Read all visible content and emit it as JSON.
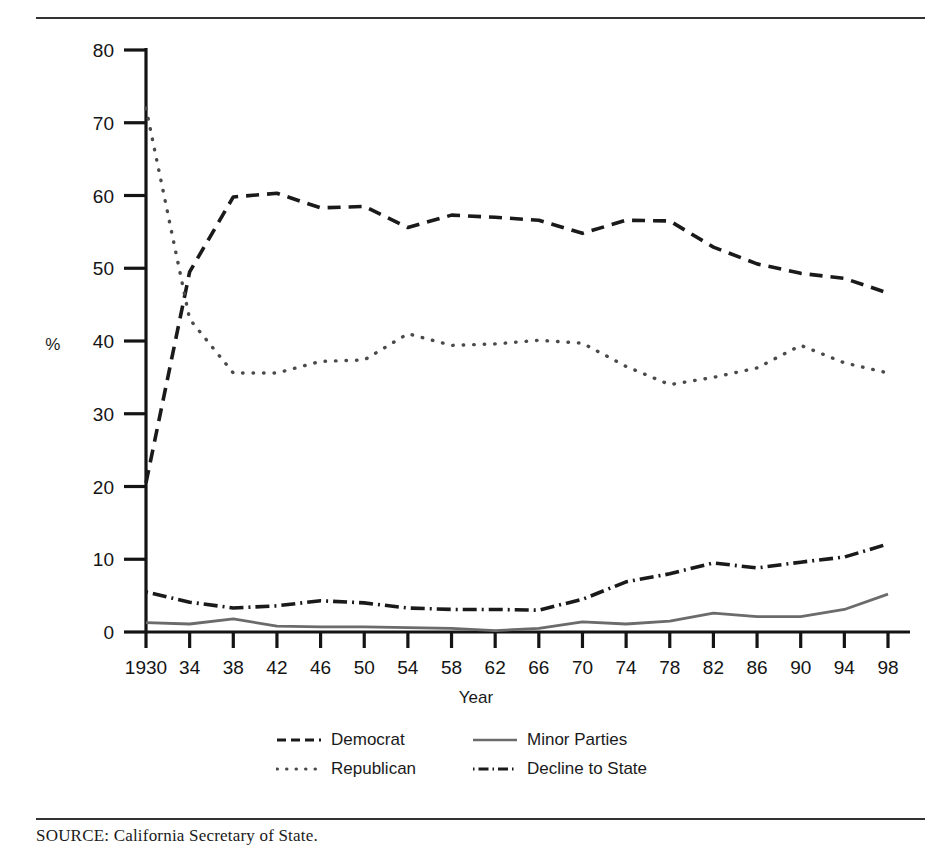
{
  "figure": {
    "ylabel": "%",
    "xlabel": "Year",
    "source_note": "SOURCE: California Secretary of State."
  },
  "legend": {
    "position": "bottom-center",
    "items": [
      {
        "label": "Democrat",
        "key": "dashed",
        "color": "#1a1a1a"
      },
      {
        "label": "Minor Parties",
        "key": "solid",
        "color": "#6b6b6b"
      },
      {
        "label": "Republican",
        "key": "dotted",
        "color": "#4a4a4a"
      },
      {
        "label": "Decline to State",
        "key": "dashdot",
        "color": "#1a1a1a"
      }
    ]
  },
  "chart_data": {
    "type": "line",
    "title": "",
    "xlabel": "Year",
    "ylabel": "%",
    "xlim": [
      1930,
      1998
    ],
    "ylim": [
      0,
      80
    ],
    "ytick_step": 10,
    "yticks": [
      0,
      10,
      20,
      30,
      40,
      50,
      60,
      70,
      80
    ],
    "xticks": [
      1930,
      1934,
      1938,
      1942,
      1946,
      1950,
      1954,
      1958,
      1962,
      1966,
      1970,
      1974,
      1978,
      1982,
      1986,
      1990,
      1994,
      1998
    ],
    "xtick_labels": [
      "1930",
      "34",
      "38",
      "42",
      "46",
      "50",
      "54",
      "58",
      "62",
      "66",
      "70",
      "74",
      "78",
      "82",
      "86",
      "90",
      "94",
      "98"
    ],
    "grid": false,
    "x": [
      1930,
      1934,
      1938,
      1942,
      1946,
      1950,
      1954,
      1958,
      1962,
      1966,
      1970,
      1974,
      1978,
      1982,
      1986,
      1990,
      1994,
      1998
    ],
    "series": [
      {
        "name": "Democrat",
        "style": "dashed",
        "color": "#1a1a1a",
        "values": [
          20.5,
          49.5,
          59.8,
          60.3,
          58.3,
          58.5,
          55.6,
          57.3,
          57.0,
          56.6,
          54.8,
          56.6,
          56.5,
          52.9,
          50.6,
          49.3,
          48.6,
          46.6
        ]
      },
      {
        "name": "Republican",
        "style": "dotted",
        "color": "#4a4a4a",
        "values": [
          72.0,
          43.0,
          35.6,
          35.6,
          37.2,
          37.4,
          41.0,
          39.4,
          39.6,
          40.1,
          39.7,
          36.5,
          34.0,
          35.0,
          36.3,
          39.4,
          37.0,
          35.6
        ]
      },
      {
        "name": "Minor Parties",
        "style": "solid",
        "color": "#6b6b6b",
        "values": [
          1.3,
          1.1,
          1.8,
          0.8,
          0.7,
          0.7,
          0.6,
          0.5,
          0.2,
          0.5,
          1.4,
          1.1,
          1.5,
          2.6,
          2.1,
          2.1,
          3.1,
          5.2
        ]
      },
      {
        "name": "Decline to State",
        "style": "dashdot",
        "color": "#1a1a1a",
        "values": [
          5.5,
          4.1,
          3.3,
          3.6,
          4.3,
          4.0,
          3.3,
          3.1,
          3.1,
          3.0,
          4.5,
          6.9,
          8.0,
          9.5,
          8.8,
          9.6,
          10.3,
          12.1
        ]
      }
    ]
  }
}
